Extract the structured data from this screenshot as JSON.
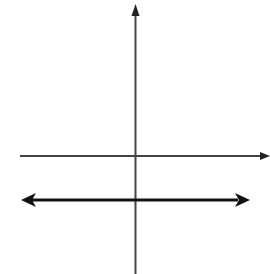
{
  "problem_number": "7",
  "equation": {
    "lhs": "y",
    "rhs": "= −3",
    "full": "y = −3"
  },
  "axes": {
    "x_label": "x",
    "y_label": "y"
  },
  "graph": {
    "type": "horizontal-line",
    "y_value": -3,
    "arrows": "both-ends",
    "grid": true,
    "tick_spacing": 1,
    "x_ticks_visible": [
      -7,
      -6,
      -5,
      -4,
      -3,
      -2,
      -1,
      1,
      2,
      3,
      4,
      5,
      6,
      7
    ],
    "y_ticks_visible": [
      7,
      6,
      5,
      4,
      3,
      2,
      1,
      -1,
      -2,
      -3,
      -4,
      -5,
      -6,
      -7,
      -8
    ]
  },
  "colors": {
    "axis": "#444444",
    "line": "#111111",
    "grid": "#bbbbbb",
    "text": "#222222"
  }
}
